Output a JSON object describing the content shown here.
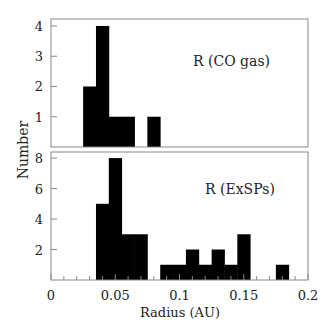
{
  "chart_data": [
    {
      "type": "bar",
      "panel": "top",
      "annotation": "R (CO gas)",
      "xlabel": "Radius (AU)",
      "ylabel": "Number",
      "xlim": [
        0,
        0.2
      ],
      "ylim": [
        0,
        4.23
      ],
      "yticks": [
        1,
        2,
        3,
        4
      ],
      "bin_width": 0.01,
      "bins": [
        {
          "x0": 0.025,
          "x1": 0.035,
          "value": 2
        },
        {
          "x0": 0.035,
          "x1": 0.045,
          "value": 4
        },
        {
          "x0": 0.045,
          "x1": 0.055,
          "value": 1
        },
        {
          "x0": 0.055,
          "x1": 0.065,
          "value": 1
        },
        {
          "x0": 0.075,
          "x1": 0.085,
          "value": 1
        }
      ]
    },
    {
      "type": "bar",
      "panel": "bottom",
      "annotation": "R (ExSPs)",
      "xlabel": "Radius (AU)",
      "ylabel": "Number",
      "xlim": [
        0,
        0.2
      ],
      "ylim": [
        0,
        8.4
      ],
      "yticks": [
        2,
        4,
        6,
        8
      ],
      "xticks": [
        0,
        0.05,
        0.1,
        0.15,
        0.2
      ],
      "bin_width": 0.01,
      "bins": [
        {
          "x0": 0.035,
          "x1": 0.045,
          "value": 5
        },
        {
          "x0": 0.045,
          "x1": 0.055,
          "value": 8
        },
        {
          "x0": 0.055,
          "x1": 0.065,
          "value": 3
        },
        {
          "x0": 0.065,
          "x1": 0.075,
          "value": 3
        },
        {
          "x0": 0.085,
          "x1": 0.095,
          "value": 1
        },
        {
          "x0": 0.095,
          "x1": 0.105,
          "value": 1
        },
        {
          "x0": 0.105,
          "x1": 0.115,
          "value": 2
        },
        {
          "x0": 0.115,
          "x1": 0.125,
          "value": 1
        },
        {
          "x0": 0.125,
          "x1": 0.135,
          "value": 2
        },
        {
          "x0": 0.135,
          "x1": 0.145,
          "value": 1
        },
        {
          "x0": 0.145,
          "x1": 0.155,
          "value": 3
        },
        {
          "x0": 0.175,
          "x1": 0.185,
          "value": 1
        }
      ]
    }
  ],
  "labels": {
    "ylabel": "Number",
    "xlabel": "Radius (AU)",
    "top_annotation": "R (CO gas)",
    "bottom_annotation": "R (ExSPs)",
    "xtick_labels": [
      "0",
      "0.05",
      "0.1",
      "0.15",
      "0.2"
    ],
    "top_ytick_labels": [
      "1",
      "2",
      "3",
      "4"
    ],
    "bottom_ytick_labels": [
      "2",
      "4",
      "6",
      "8"
    ]
  },
  "colors": {
    "bar": "#000000",
    "axis": "#777777",
    "text": "#222222"
  }
}
